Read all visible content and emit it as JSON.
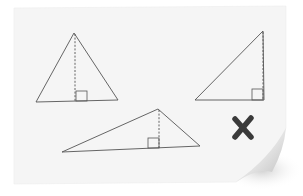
{
  "figure": {
    "description": "Worksheet showing three triangles with dashed altitudes and right-angle markers; the set is marked incorrect with an X",
    "background_color": "#ffffff",
    "paper_color": "#f5f5f5",
    "line_color": "#555555",
    "mark_color": "#3a3a3a"
  },
  "triangles": [
    {
      "name": "acute-triangle",
      "vertices": [
        [
          74,
          33
        ],
        [
          36,
          102
        ],
        [
          118,
          100
        ]
      ],
      "altitude": [
        [
          75,
          34
        ],
        [
          75,
          101
        ]
      ],
      "right_angle_box": [
        76,
        91,
        11,
        10
      ]
    },
    {
      "name": "right-triangle",
      "vertices": [
        [
          263,
          31
        ],
        [
          195,
          100
        ],
        [
          264,
          100
        ]
      ],
      "altitude": [
        [
          263,
          32
        ],
        [
          263,
          100
        ]
      ],
      "right_angle_box": [
        252,
        89,
        11,
        11
      ]
    },
    {
      "name": "obtuse-triangle",
      "vertices": [
        [
          158,
          109
        ],
        [
          62,
          152
        ],
        [
          200,
          146
        ]
      ],
      "altitude": [
        [
          159,
          110
        ],
        [
          159,
          148
        ]
      ],
      "right_angle_box": [
        148,
        138,
        11,
        10
      ]
    }
  ],
  "mark": {
    "symbol": "✘",
    "meaning": "incorrect",
    "center": [
      243,
      128
    ]
  }
}
